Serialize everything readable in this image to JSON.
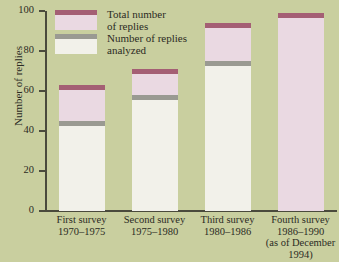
{
  "figure": {
    "clipped_top_text": "",
    "background_color": "#c9cf9f"
  },
  "legend": {
    "items": [
      {
        "label": "Total number\nof replies",
        "cap_color": "#a45f74",
        "body_color": "#ead9e2",
        "name": "total-replies"
      },
      {
        "label": "Number of replies\nanalyzed",
        "cap_color": "#9a9a92",
        "body_color": "#f2f1ea",
        "name": "replies-analyzed"
      }
    ]
  },
  "chart_data": {
    "type": "bar",
    "title": "",
    "xlabel": "",
    "ylabel": "Number of replies",
    "ylim": [
      0,
      100
    ],
    "yticks": [
      0,
      20,
      40,
      60,
      80,
      100
    ],
    "grid": false,
    "legend_position": "upper-left-inside",
    "categories": [
      "First survey\n1970–1975",
      "Second survey\n1975–1980",
      "Third survey\n1980–1986",
      "Fourth survey\n1986–1990\n(as of December\n1994)"
    ],
    "series": [
      {
        "name": "Total number of replies",
        "values": [
          63,
          71,
          94,
          99
        ]
      },
      {
        "name": "Number of replies analyzed",
        "values": [
          45,
          58,
          75,
          0
        ]
      }
    ]
  }
}
